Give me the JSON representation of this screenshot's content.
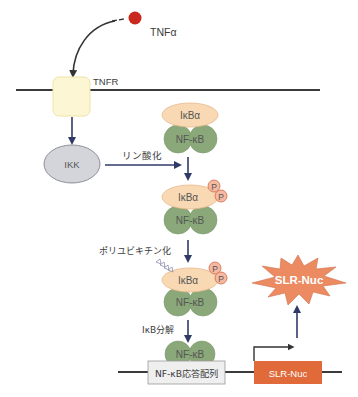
{
  "diagram": {
    "type": "signaling-pathway",
    "ligand": {
      "label": "TNFα",
      "color": "#c8281e"
    },
    "receptor": {
      "label": "TNFR",
      "color": "#fdf6d4"
    },
    "kinase": {
      "label": "IKK",
      "color": "#d4d5db"
    },
    "steps": {
      "phosphorylation": "リン酸化",
      "polyubiquitination": "ポリユビキチン化",
      "degradation": "IκB分解"
    },
    "complex": {
      "inhibitor_label": "IκBα",
      "inhibitor_color": "#f8d9b4",
      "factor_label": "NF-κB",
      "factor_color": "#8aa879",
      "phospho_label": "P",
      "phospho_color": "#f5b8a0"
    },
    "dna": {
      "response_element": "NF-κB応答配列",
      "response_element_color": "#efefef",
      "gene": "SLR-Nuc",
      "gene_color": "#e06a3a"
    },
    "product": {
      "label": "SLR-Nuc",
      "color": "#ec8a62"
    },
    "colors": {
      "arrow": "#2f3b66",
      "membrane": "#3a3a3a"
    }
  }
}
